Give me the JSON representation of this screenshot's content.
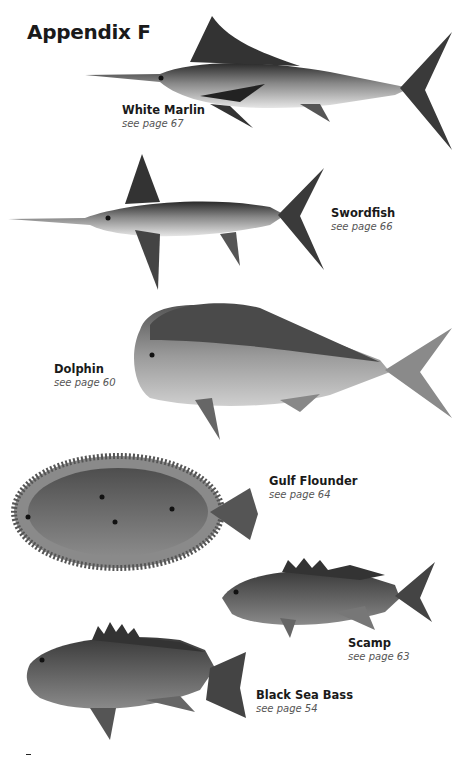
{
  "page": {
    "title": "Appendix F"
  },
  "fish": [
    {
      "name": "White Marlin",
      "ref": "see page 67",
      "icon": "white-marlin-illustration"
    },
    {
      "name": "Swordfish",
      "ref": "see page 66",
      "icon": "swordfish-illustration"
    },
    {
      "name": "Dolphin",
      "ref": "see page 60",
      "icon": "dolphin-illustration"
    },
    {
      "name": "Gulf Flounder",
      "ref": "see page 64",
      "icon": "gulf-flounder-illustration"
    },
    {
      "name": "Scamp",
      "ref": "see page 63",
      "icon": "scamp-illustration"
    },
    {
      "name": "Black Sea Bass",
      "ref": "see page 54",
      "icon": "black-sea-bass-illustration"
    }
  ]
}
